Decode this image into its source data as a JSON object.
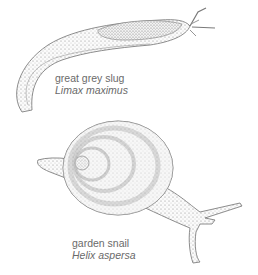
{
  "illustrations": [
    {
      "id": "slug",
      "common_name": "great grey slug",
      "latin_name": "Limax maximus"
    },
    {
      "id": "snail",
      "common_name": "garden snail",
      "latin_name": "Helix aspersa"
    }
  ],
  "colors": {
    "background": "#ffffff",
    "ink": "#7a7a7a",
    "label_text": "#6a6a6a"
  }
}
